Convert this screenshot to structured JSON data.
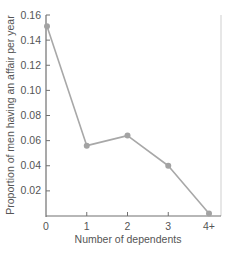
{
  "chart_data": {
    "type": "line",
    "title": "",
    "xlabel": "Number of dependents",
    "ylabel": "Proportion of men having an affair per year",
    "categories": [
      "0",
      "1",
      "2",
      "3",
      "4+"
    ],
    "series": [
      {
        "name": "Proportion of men having an affair per year",
        "values": [
          0.151,
          0.056,
          0.064,
          0.04,
          0.002
        ]
      }
    ],
    "yticks": [
      "0.02",
      "0.04",
      "0.06",
      "0.08",
      "0.10",
      "0.12",
      "0.14",
      "0.16"
    ],
    "ylim": [
      0,
      0.16
    ],
    "grid": false,
    "legend": "none",
    "colors": {
      "line": "#a8a8a8",
      "marker": "#a3a3a3",
      "axis": "#707070",
      "frame": "#cfcfcf",
      "text": "#555555"
    }
  }
}
